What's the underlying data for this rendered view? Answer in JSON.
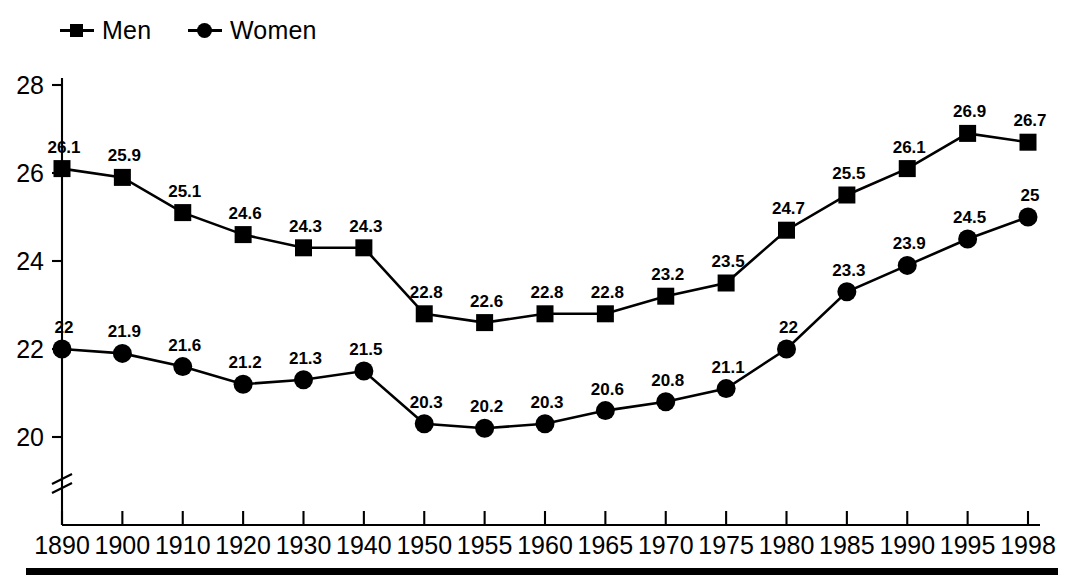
{
  "legend": {
    "position": "top-left",
    "entries": [
      {
        "label": "Men",
        "marker": "square-marker"
      },
      {
        "label": "Women",
        "marker": "circle-marker"
      }
    ]
  },
  "axes": {
    "y_ticks": [
      "28",
      "26",
      "24",
      "22",
      "20"
    ],
    "y_break": true,
    "x_ticks": [
      "1890",
      "1900",
      "1910",
      "1920",
      "1930",
      "1940",
      "1950",
      "1955",
      "1960",
      "1965",
      "1970",
      "1975",
      "1980",
      "1985",
      "1990",
      "1995",
      "1998"
    ]
  },
  "colors": {
    "series": "#000000",
    "axis": "#000000",
    "background": "#ffffff"
  },
  "chart_data": {
    "type": "line",
    "title": "",
    "subtitle": "",
    "xlabel": "",
    "ylabel": "",
    "ylim": [
      20,
      28
    ],
    "grid": false,
    "legend_position": "top-left",
    "axis_break_below": 20,
    "categories": [
      "1890",
      "1900",
      "1910",
      "1920",
      "1930",
      "1940",
      "1950",
      "1955",
      "1960",
      "1965",
      "1970",
      "1975",
      "1980",
      "1985",
      "1990",
      "1995",
      "1998"
    ],
    "series": [
      {
        "name": "Men",
        "marker": "square",
        "values": [
          26.1,
          25.9,
          25.1,
          24.6,
          24.3,
          24.3,
          22.8,
          22.6,
          22.8,
          22.8,
          23.2,
          23.5,
          24.7,
          25.5,
          26.1,
          26.9,
          26.7
        ],
        "labels": [
          "26.1",
          "25.9",
          "25.1",
          "24.6",
          "24.3",
          "24.3",
          "22.8",
          "22.6",
          "22.8",
          "22.8",
          "23.2",
          "23.5",
          "24.7",
          "25.5",
          "26.1",
          "26.9",
          "26.7"
        ]
      },
      {
        "name": "Women",
        "marker": "circle",
        "values": [
          22,
          21.9,
          21.6,
          21.2,
          21.3,
          21.5,
          20.3,
          20.2,
          20.3,
          20.6,
          20.8,
          21.1,
          22,
          23.3,
          23.9,
          24.5,
          25
        ],
        "labels": [
          "22",
          "21.9",
          "21.6",
          "21.2",
          "21.3",
          "21.5",
          "20.3",
          "20.2",
          "20.3",
          "20.6",
          "20.8",
          "21.1",
          "22",
          "23.3",
          "23.9",
          "24.5",
          "25"
        ]
      }
    ]
  }
}
